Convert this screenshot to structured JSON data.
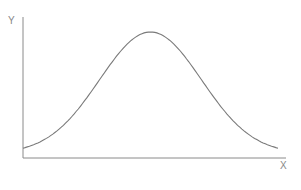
{
  "chart_data": {
    "type": "line",
    "title": "",
    "xlabel": "X",
    "ylabel": "Y",
    "grid": false,
    "legend": null,
    "series": [
      {
        "name": "bell curve",
        "shape": "gaussian",
        "x": [
          0.0,
          0.1,
          0.2,
          0.3,
          0.4,
          0.5,
          0.6,
          0.7,
          0.8,
          0.9,
          1.0
        ],
        "values": [
          0.04,
          0.12,
          0.3,
          0.56,
          0.85,
          1.0,
          0.85,
          0.56,
          0.3,
          0.12,
          0.04
        ]
      }
    ],
    "xlim": [
      0,
      1
    ],
    "ylim": [
      0,
      1.1
    ],
    "colors": {
      "axis": "#8a8a8a",
      "curve": "#7a7a7a",
      "label": "#888888"
    }
  },
  "axes": {
    "x_label": "X",
    "y_label": "Y"
  }
}
